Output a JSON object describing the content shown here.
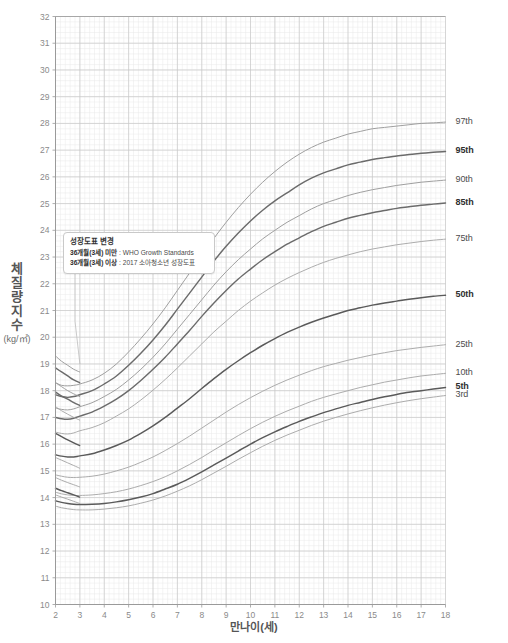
{
  "chart_data": {
    "type": "line",
    "title": "",
    "subtitle": "",
    "xlabel": "만나이(세)",
    "ylabel": "체질량지수",
    "ylabel_unit": "(kg/㎡)",
    "xlim": [
      2,
      18
    ],
    "ylim": [
      10,
      32
    ],
    "xticks": [
      2,
      3,
      4,
      5,
      6,
      7,
      8,
      9,
      10,
      11,
      12,
      13,
      14,
      15,
      16,
      17,
      18
    ],
    "yticks": [
      10,
      11,
      12,
      13,
      14,
      15,
      16,
      17,
      18,
      19,
      20,
      21,
      22,
      23,
      24,
      25,
      26,
      27,
      28,
      29,
      30,
      31,
      32
    ],
    "grid": true,
    "minor_grid": true,
    "minor_divisions": 5,
    "legend_position": "right-outside",
    "x": [
      2,
      2.25,
      2.5,
      2.75,
      3,
      3.5,
      4,
      4.5,
      5,
      5.5,
      6,
      6.5,
      7,
      7.5,
      8,
      8.5,
      9,
      9.5,
      10,
      10.5,
      11,
      11.5,
      12,
      12.5,
      13,
      13.5,
      14,
      14.5,
      15,
      15.5,
      16,
      16.5,
      17,
      17.5,
      18
    ],
    "series": [
      {
        "name": "97th",
        "label": "97th",
        "bold": false,
        "color": "#9a9a9a",
        "segment_a_x": [
          2,
          2.25,
          2.5,
          2.75,
          2.99
        ],
        "segment_a_y": [
          19.3,
          19.1,
          18.95,
          18.8,
          18.7
        ],
        "values": [
          18.3,
          18.2,
          18.18,
          18.2,
          18.25,
          18.4,
          18.65,
          19.0,
          19.45,
          19.95,
          20.5,
          21.1,
          21.75,
          22.4,
          23.05,
          23.7,
          24.3,
          24.85,
          25.35,
          25.8,
          26.2,
          26.55,
          26.85,
          27.1,
          27.3,
          27.45,
          27.6,
          27.7,
          27.8,
          27.85,
          27.9,
          27.95,
          28.0,
          28.02,
          28.05
        ]
      },
      {
        "name": "95th",
        "label": "95th",
        "bold": true,
        "color": "#6b6b6b",
        "segment_a_x": [
          2,
          2.25,
          2.5,
          2.75,
          2.99
        ],
        "segment_a_y": [
          18.85,
          18.7,
          18.55,
          18.4,
          18.3
        ],
        "values": [
          17.85,
          17.78,
          17.75,
          17.78,
          17.85,
          18.0,
          18.25,
          18.55,
          18.95,
          19.4,
          19.9,
          20.45,
          21.05,
          21.65,
          22.25,
          22.85,
          23.4,
          23.9,
          24.35,
          24.75,
          25.1,
          25.4,
          25.7,
          25.95,
          26.15,
          26.3,
          26.45,
          26.55,
          26.65,
          26.72,
          26.78,
          26.84,
          26.88,
          26.92,
          26.95
        ]
      },
      {
        "name": "90th",
        "label": "90th",
        "bold": false,
        "color": "#9a9a9a",
        "segment_a_x": [
          2,
          2.25,
          2.5,
          2.75,
          2.99
        ],
        "segment_a_y": [
          18.3,
          18.15,
          18.0,
          17.88,
          17.78
        ],
        "values": [
          17.35,
          17.3,
          17.28,
          17.32,
          17.4,
          17.55,
          17.78,
          18.05,
          18.4,
          18.8,
          19.25,
          19.75,
          20.3,
          20.85,
          21.4,
          21.95,
          22.45,
          22.9,
          23.3,
          23.68,
          24.0,
          24.3,
          24.55,
          24.8,
          25.0,
          25.15,
          25.3,
          25.42,
          25.52,
          25.6,
          25.68,
          25.74,
          25.8,
          25.84,
          25.88
        ]
      },
      {
        "name": "85th",
        "label": "85th",
        "bold": true,
        "color": "#6b6b6b",
        "segment_a_x": [
          2,
          2.25,
          2.5,
          2.75,
          2.99
        ],
        "segment_a_y": [
          17.95,
          17.8,
          17.68,
          17.55,
          17.45
        ],
        "values": [
          17.0,
          16.95,
          16.93,
          16.97,
          17.05,
          17.2,
          17.42,
          17.68,
          18.0,
          18.38,
          18.8,
          19.25,
          19.75,
          20.25,
          20.78,
          21.28,
          21.75,
          22.18,
          22.55,
          22.9,
          23.2,
          23.48,
          23.72,
          23.95,
          24.15,
          24.3,
          24.45,
          24.56,
          24.66,
          24.74,
          24.82,
          24.88,
          24.94,
          24.98,
          25.02
        ]
      },
      {
        "name": "75th",
        "label": "75th",
        "bold": false,
        "color": "#a8a8a8",
        "segment_a_x": [
          2,
          2.25,
          2.5,
          2.75,
          2.99
        ],
        "segment_a_y": [
          17.4,
          17.25,
          17.12,
          17.0,
          16.9
        ],
        "values": [
          16.45,
          16.4,
          16.38,
          16.42,
          16.5,
          16.62,
          16.8,
          17.05,
          17.32,
          17.65,
          18.02,
          18.42,
          18.85,
          19.3,
          19.75,
          20.2,
          20.6,
          21.0,
          21.35,
          21.66,
          21.95,
          22.2,
          22.42,
          22.62,
          22.8,
          22.95,
          23.08,
          23.2,
          23.3,
          23.38,
          23.46,
          23.52,
          23.58,
          23.63,
          23.67
        ]
      },
      {
        "name": "50th",
        "label": "50th",
        "bold": true,
        "color": "#5a5a5a",
        "segment_a_x": [
          2,
          2.25,
          2.5,
          2.75,
          2.99
        ],
        "segment_a_y": [
          16.4,
          16.28,
          16.16,
          16.05,
          15.95
        ],
        "values": [
          15.6,
          15.55,
          15.52,
          15.52,
          15.56,
          15.64,
          15.78,
          15.95,
          16.15,
          16.4,
          16.68,
          17.0,
          17.35,
          17.7,
          18.08,
          18.45,
          18.8,
          19.12,
          19.42,
          19.7,
          19.95,
          20.18,
          20.38,
          20.56,
          20.72,
          20.86,
          21.0,
          21.1,
          21.2,
          21.28,
          21.35,
          21.42,
          21.48,
          21.53,
          21.57
        ]
      },
      {
        "name": "25th",
        "label": "25th",
        "bold": false,
        "color": "#a8a8a8",
        "segment_a_x": [
          2,
          2.25,
          2.5,
          2.75,
          2.99
        ],
        "segment_a_y": [
          15.5,
          15.4,
          15.3,
          15.2,
          15.1
        ],
        "values": [
          14.85,
          14.8,
          14.76,
          14.75,
          14.76,
          14.8,
          14.88,
          15.0,
          15.14,
          15.32,
          15.52,
          15.76,
          16.02,
          16.3,
          16.6,
          16.9,
          17.2,
          17.48,
          17.74,
          17.98,
          18.2,
          18.4,
          18.58,
          18.75,
          18.9,
          19.02,
          19.14,
          19.24,
          19.34,
          19.42,
          19.5,
          19.56,
          19.62,
          19.67,
          19.72
        ]
      },
      {
        "name": "10th",
        "label": "10th",
        "bold": false,
        "color": "#a8a8a8",
        "segment_a_x": [
          2,
          2.25,
          2.5,
          2.75,
          2.99
        ],
        "segment_a_y": [
          14.75,
          14.65,
          14.56,
          14.48,
          14.4
        ],
        "values": [
          14.2,
          14.14,
          14.1,
          14.08,
          14.08,
          14.1,
          14.15,
          14.22,
          14.32,
          14.45,
          14.6,
          14.78,
          15.0,
          15.24,
          15.5,
          15.78,
          16.05,
          16.32,
          16.58,
          16.82,
          17.04,
          17.24,
          17.42,
          17.6,
          17.75,
          17.88,
          18.0,
          18.12,
          18.22,
          18.32,
          18.4,
          18.48,
          18.55,
          18.6,
          18.65
        ]
      },
      {
        "name": "5th",
        "label": "5th",
        "bold": true,
        "color": "#5a5a5a",
        "segment_a_x": [
          2,
          2.25,
          2.5,
          2.75,
          2.99
        ],
        "segment_a_y": [
          14.35,
          14.26,
          14.18,
          14.1,
          14.02
        ],
        "values": [
          13.88,
          13.82,
          13.78,
          13.75,
          13.74,
          13.75,
          13.78,
          13.84,
          13.92,
          14.02,
          14.15,
          14.32,
          14.5,
          14.72,
          14.96,
          15.22,
          15.48,
          15.74,
          16.0,
          16.24,
          16.46,
          16.66,
          16.85,
          17.02,
          17.18,
          17.32,
          17.45,
          17.56,
          17.67,
          17.77,
          17.86,
          17.94,
          18.0,
          18.06,
          18.12
        ]
      },
      {
        "name": "3rd",
        "label": "3rd",
        "bold": false,
        "color": "#a8a8a8",
        "segment_a_x": [
          2,
          2.25,
          2.5,
          2.75,
          2.99
        ],
        "segment_a_y": [
          14.1,
          14.02,
          13.94,
          13.86,
          13.78
        ],
        "values": [
          13.68,
          13.62,
          13.58,
          13.55,
          13.54,
          13.54,
          13.57,
          13.62,
          13.69,
          13.79,
          13.91,
          14.06,
          14.24,
          14.44,
          14.67,
          14.92,
          15.17,
          15.43,
          15.68,
          15.92,
          16.14,
          16.34,
          16.52,
          16.7,
          16.86,
          17.0,
          17.13,
          17.25,
          17.36,
          17.46,
          17.55,
          17.63,
          17.7,
          17.76,
          17.82
        ]
      }
    ]
  },
  "annotation": {
    "title": "성장도표 변경",
    "line1_label": "36개월(3세) 미만",
    "line1_value": "WHO Growth Standards",
    "line2_label": "36개월(3세) 이상",
    "line2_value": "2017 소아청소년 성장도표",
    "separator": " : "
  },
  "colors": {
    "major_grid": "#c8c8c8",
    "minor_grid": "#e8e8e8",
    "axis": "#9a9a9a",
    "tick_text": "#8a8a8a",
    "curve_light": "#a8a8a8",
    "curve_dark": "#5a5a5a",
    "background": "#ffffff"
  }
}
